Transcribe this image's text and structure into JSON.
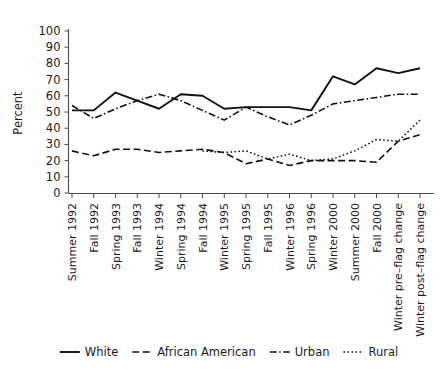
{
  "chart_data": {
    "type": "line",
    "title": "",
    "xlabel": "",
    "ylabel": "Percent",
    "ylim": [
      0,
      100
    ],
    "yticks": [
      0,
      10,
      20,
      30,
      40,
      50,
      60,
      70,
      80,
      90,
      100
    ],
    "grid": false,
    "legend_position": "bottom",
    "categories": [
      "Summer 1992",
      "Fall 1992",
      "Spring 1993",
      "Fall 1993",
      "Winter 1994",
      "Spring 1994",
      "Fall 1994",
      "Winter 1995",
      "Spring 1995",
      "Fall 1995",
      "Winter 1996",
      "Spring 1996",
      "Winter 2000",
      "Summer 2000",
      "Fall 2000",
      "Winter pre–flag change",
      "Winter post–flag change"
    ],
    "series": [
      {
        "name": "White",
        "style": "solid",
        "values": [
          51,
          51,
          62,
          57,
          52,
          61,
          60,
          52,
          53,
          53,
          53,
          51,
          72,
          67,
          77,
          74,
          77
        ]
      },
      {
        "name": "African American",
        "style": "dashed",
        "values": [
          26,
          23,
          27,
          27,
          25,
          26,
          27,
          25,
          18,
          21,
          17,
          20,
          20,
          20,
          19,
          32,
          36
        ]
      },
      {
        "name": "Urban",
        "style": "dash-dot",
        "values": [
          54,
          46,
          52,
          57,
          61,
          57,
          51,
          45,
          53,
          47,
          42,
          48,
          55,
          57,
          59,
          61,
          61
        ]
      },
      {
        "name": "Rural",
        "style": "dotted",
        "values": [
          null,
          null,
          null,
          null,
          null,
          null,
          26,
          25,
          26,
          21,
          24,
          20,
          21,
          26,
          33,
          32,
          45
        ]
      }
    ]
  },
  "legend": {
    "items": [
      {
        "label": "White",
        "style": "solid"
      },
      {
        "label": "African American",
        "style": "dashed"
      },
      {
        "label": "Urban",
        "style": "dash-dot"
      },
      {
        "label": "Rural",
        "style": "dotted"
      }
    ]
  },
  "colors": {
    "line": "#111111",
    "axis": "#4a4a4a",
    "text": "#1a1a1a",
    "background": "#ffffff"
  }
}
